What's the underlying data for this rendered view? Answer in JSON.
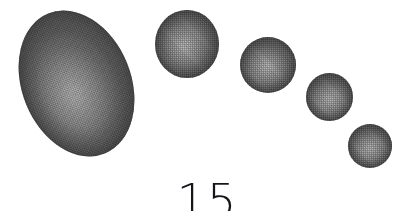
{
  "figure": {
    "caption_number": "15",
    "background_color": "#ffffff",
    "ink_color": "#14161a",
    "rendering": "halftone-dither-scan",
    "shape_fill_light": "#bcbcbc",
    "shape_fill_mid": "#9a9a9a",
    "shape_fill_dark": "#7b7b7b",
    "shape_edge_dark": "#6e6e6e",
    "shapes": [
      {
        "name": "ellipse-1",
        "order": 1,
        "kind": "ellipse",
        "left": 22,
        "top": 8,
        "width": 109,
        "height": 151,
        "rotation_deg": -22,
        "highlight_x_pct": 44,
        "highlight_y_pct": 56
      },
      {
        "name": "sphere-2",
        "order": 2,
        "kind": "sphere",
        "left": 155,
        "top": 10,
        "width": 64,
        "height": 68,
        "rotation_deg": 0,
        "highlight_x_pct": 47,
        "highlight_y_pct": 52
      },
      {
        "name": "sphere-3",
        "order": 3,
        "kind": "sphere",
        "left": 240,
        "top": 37,
        "width": 56,
        "height": 56,
        "rotation_deg": 0,
        "highlight_x_pct": 48,
        "highlight_y_pct": 54
      },
      {
        "name": "sphere-4",
        "order": 4,
        "kind": "sphere",
        "left": 306,
        "top": 73,
        "width": 47,
        "height": 48,
        "rotation_deg": 0,
        "highlight_x_pct": 50,
        "highlight_y_pct": 55
      },
      {
        "name": "sphere-5",
        "order": 5,
        "kind": "sphere",
        "left": 348,
        "top": 124,
        "width": 44,
        "height": 44,
        "rotation_deg": 0,
        "highlight_x_pct": 50,
        "highlight_y_pct": 55
      }
    ],
    "caption_position": {
      "center_x": 207,
      "top": 178,
      "font_size_px": 46,
      "clipped_at_bottom": true
    }
  }
}
